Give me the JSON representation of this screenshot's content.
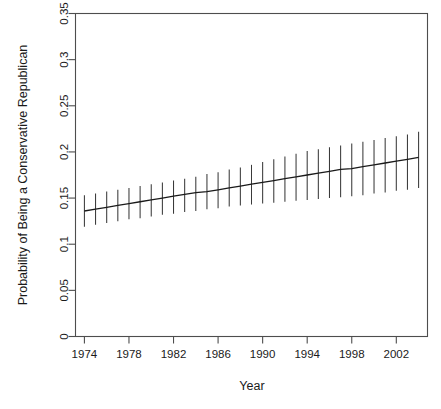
{
  "chart_data": {
    "type": "line",
    "title": "",
    "subtitle": "",
    "xlabel": "Year",
    "ylabel": "Probability of Being a Conservative Republican",
    "xlim": [
      1973.2,
      2004.8
    ],
    "ylim": [
      0,
      0.35
    ],
    "grid": false,
    "legend": null,
    "legend_position": "none",
    "annotations": [],
    "xticks": [
      1974,
      1978,
      1982,
      1986,
      1990,
      1994,
      1998,
      2002
    ],
    "xtick_labels": [
      "1974",
      "1978",
      "1982",
      "1986",
      "1990",
      "1994",
      "1998",
      "2002"
    ],
    "yticks": [
      0,
      0.05,
      0.1,
      0.15,
      0.2,
      0.25,
      0.3,
      0.35
    ],
    "ytick_labels": [
      "0",
      "0.05",
      "0.1",
      "0.15",
      "0.2",
      "0.25",
      "0.3",
      "0.35"
    ],
    "error_style": "vertical-bars-no-caps",
    "line_color": "#1a1a1a",
    "errorbar_color": "#3a3a3a",
    "axis_color": "#4d4d4d",
    "background_color": "#ffffff",
    "x": [
      1974,
      1975,
      1976,
      1977,
      1978,
      1979,
      1980,
      1981,
      1982,
      1983,
      1984,
      1985,
      1986,
      1987,
      1988,
      1989,
      1990,
      1991,
      1992,
      1993,
      1994,
      1995,
      1996,
      1997,
      1998,
      1999,
      2000,
      2001,
      2002,
      2003,
      2004
    ],
    "series": [
      {
        "name": "Probability of Being a Conservative Republican",
        "values": [
          0.136,
          0.138,
          0.14,
          0.142,
          0.144,
          0.146,
          0.148,
          0.15,
          0.152,
          0.154,
          0.156,
          0.157,
          0.159,
          0.161,
          0.163,
          0.165,
          0.167,
          0.169,
          0.171,
          0.173,
          0.175,
          0.177,
          0.179,
          0.181,
          0.182,
          0.184,
          0.186,
          0.188,
          0.19,
          0.192,
          0.194
        ],
        "lower": [
          0.119,
          0.121,
          0.123,
          0.125,
          0.127,
          0.128,
          0.13,
          0.132,
          0.133,
          0.135,
          0.136,
          0.138,
          0.139,
          0.141,
          0.142,
          0.143,
          0.144,
          0.145,
          0.146,
          0.147,
          0.148,
          0.149,
          0.15,
          0.151,
          0.152,
          0.153,
          0.155,
          0.156,
          0.158,
          0.159,
          0.161
        ],
        "upper": [
          0.153,
          0.155,
          0.157,
          0.159,
          0.161,
          0.163,
          0.165,
          0.167,
          0.169,
          0.171,
          0.173,
          0.176,
          0.178,
          0.181,
          0.183,
          0.186,
          0.189,
          0.192,
          0.195,
          0.198,
          0.201,
          0.203,
          0.205,
          0.207,
          0.209,
          0.211,
          0.213,
          0.215,
          0.217,
          0.219,
          0.222
        ]
      }
    ]
  }
}
